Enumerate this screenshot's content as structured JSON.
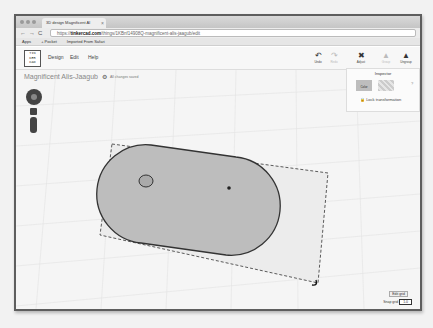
{
  "browser": {
    "tab_title": "3D design Magnificent Al",
    "url_prefix": "https://",
    "url_domain": "tinkercad.com",
    "url_path": "/things/1KBnf14908Q-magnificent-alis-jaagub/edit",
    "bookmarks": [
      "Apps",
      "+ Pocket",
      "Imported From Safari"
    ]
  },
  "app": {
    "logo_text": "TIN KER CAD",
    "menu": [
      "Design",
      "Edit",
      "Help"
    ],
    "design_title": "Magnificent Alis-Jaagub",
    "save_status": "All changes saved",
    "toolbar": [
      {
        "label": "Undo",
        "icon": "↶",
        "enabled": true
      },
      {
        "label": "Redo",
        "icon": "↷",
        "enabled": false
      },
      {
        "label": "Adjust",
        "icon": "✖",
        "enabled": true
      },
      {
        "label": "Group",
        "icon": "▲",
        "enabled": false
      },
      {
        "label": "Ungroup",
        "icon": "▲",
        "enabled": true
      }
    ]
  },
  "inspector": {
    "title": "Inspector",
    "solid_label": "Color",
    "help": "?",
    "lock_label": "Lock transformation"
  },
  "footer": {
    "edit_grid": "Edit grid",
    "snap_label": "Snap grid",
    "snap_value": "1.0"
  }
}
